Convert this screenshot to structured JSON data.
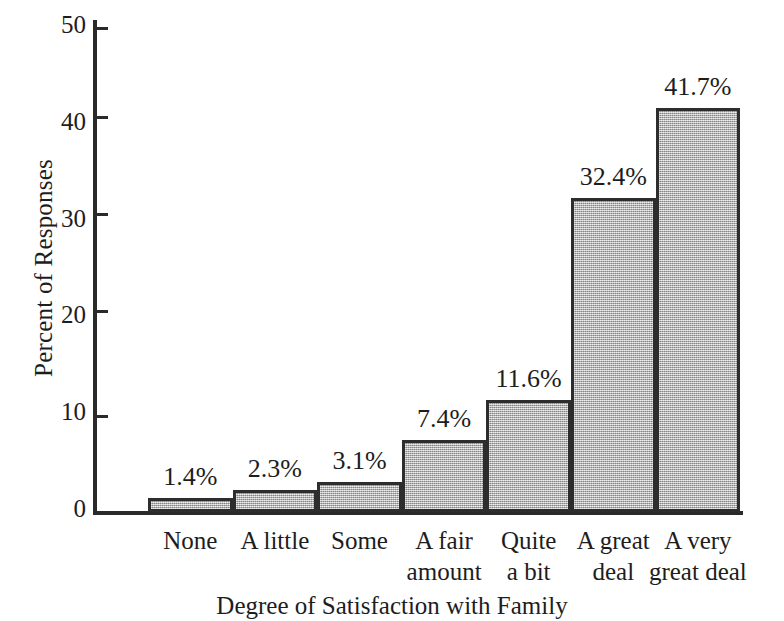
{
  "chart_data": {
    "type": "bar",
    "title": "",
    "xlabel": "Degree of Satisfaction with Family",
    "ylabel": "Percent of Responses",
    "categories": [
      "None",
      "A little",
      "Some",
      "A fair\namount",
      "Quite\na bit",
      "A great\ndeal",
      "A very\ngreat deal"
    ],
    "category_lines": [
      [
        "None"
      ],
      [
        "A little"
      ],
      [
        "Some"
      ],
      [
        "A fair",
        "amount"
      ],
      [
        "Quite",
        "a bit"
      ],
      [
        "A great",
        "deal"
      ],
      [
        "A very",
        "great deal"
      ]
    ],
    "values": [
      1.4,
      2.3,
      3.1,
      7.4,
      11.6,
      32.4,
      41.7
    ],
    "data_labels": [
      "1.4%",
      "2.3%",
      "3.1%",
      "7.4%",
      "11.6%",
      "32.4%",
      "41.7%"
    ],
    "ylim": [
      0,
      50
    ],
    "yticks": [
      0,
      10,
      20,
      30,
      40,
      50
    ],
    "ytick_labels": [
      "0",
      "10",
      "20",
      "30",
      "40",
      "50"
    ],
    "grid": false,
    "legend": "none",
    "bar_fill_color": "#b4b4b4",
    "bar_border_color": "#2d2d2d",
    "axis_color": "#2a2a2a"
  },
  "ytick_labels": {
    "t0": "0",
    "t1": "10",
    "t2": "20",
    "t3": "30",
    "t4": "40",
    "t5": "50"
  },
  "bars": [
    {
      "label": "1.4%",
      "line1": "None",
      "line2": ""
    },
    {
      "label": "2.3%",
      "line1": "A little",
      "line2": ""
    },
    {
      "label": "3.1%",
      "line1": "Some",
      "line2": ""
    },
    {
      "label": "7.4%",
      "line1": "A fair",
      "line2": "amount"
    },
    {
      "label": "11.6%",
      "line1": "Quite",
      "line2": "a bit"
    },
    {
      "label": "32.4%",
      "line1": "A great",
      "line2": "deal"
    },
    {
      "label": "41.7%",
      "line1": "A very",
      "line2": "great deal"
    }
  ],
  "axis_titles": {
    "x": "Degree of Satisfaction with Family",
    "y": "Percent of Responses"
  }
}
